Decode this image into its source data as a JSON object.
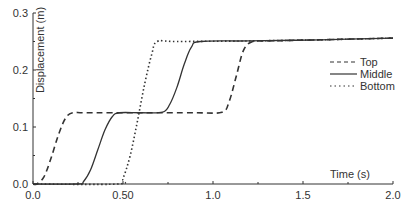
{
  "chart_data": {
    "type": "line",
    "title": "",
    "xlabel": "Time (s)",
    "ylabel": "Displacement (m)",
    "xlim": [
      0.0,
      2.0
    ],
    "ylim": [
      0.0,
      0.3
    ],
    "x_ticks": [
      "0.0",
      "0.50",
      "1.0",
      "1.5",
      "2.0"
    ],
    "x_tick_values": [
      0.0,
      0.5,
      1.0,
      1.5,
      2.0
    ],
    "y_ticks": [
      "0.0",
      "0.1",
      "0.2",
      "0.3"
    ],
    "y_tick_values": [
      0.0,
      0.1,
      0.2,
      0.3
    ],
    "grid": false,
    "legend_position": "right, upper-middle",
    "series": [
      {
        "name": "Top",
        "style": "dashed",
        "x": [
          0.0,
          0.02,
          0.06,
          0.1,
          0.14,
          0.18,
          0.22,
          0.3,
          0.6,
          0.9,
          1.05,
          1.09,
          1.13,
          1.17,
          1.22,
          1.3,
          1.6,
          2.0
        ],
        "values": [
          0.0,
          0.0,
          0.012,
          0.045,
          0.085,
          0.115,
          0.125,
          0.125,
          0.125,
          0.125,
          0.126,
          0.145,
          0.19,
          0.235,
          0.25,
          0.251,
          0.253,
          0.256
        ]
      },
      {
        "name": "Middle",
        "style": "solid",
        "x": [
          0.0,
          0.25,
          0.28,
          0.32,
          0.36,
          0.4,
          0.44,
          0.48,
          0.6,
          0.72,
          0.76,
          0.8,
          0.84,
          0.88,
          0.93,
          1.2,
          1.6,
          2.0
        ],
        "values": [
          0.0,
          0.0,
          0.004,
          0.025,
          0.06,
          0.095,
          0.118,
          0.125,
          0.125,
          0.126,
          0.14,
          0.17,
          0.21,
          0.24,
          0.25,
          0.251,
          0.253,
          0.256
        ]
      },
      {
        "name": "Bottom",
        "style": "dotted",
        "x": [
          0.0,
          0.47,
          0.5,
          0.54,
          0.58,
          0.62,
          0.66,
          0.69,
          0.8,
          1.2,
          1.6,
          2.0
        ],
        "values": [
          0.0,
          0.0,
          0.01,
          0.05,
          0.11,
          0.175,
          0.228,
          0.25,
          0.25,
          0.251,
          0.253,
          0.256
        ]
      }
    ]
  },
  "legend": {
    "items": [
      {
        "label": "Top",
        "style": "dashed"
      },
      {
        "label": "Middle",
        "style": "solid"
      },
      {
        "label": "Bottom",
        "style": "dotted"
      }
    ]
  },
  "colors": {
    "line": "#333333",
    "axis": "#333333",
    "background": "#ffffff"
  }
}
